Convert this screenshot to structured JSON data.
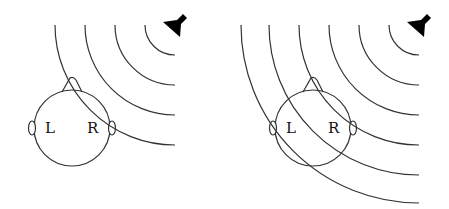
{
  "panels": [
    {
      "id": "left",
      "head": {
        "cx": 72,
        "cy": 128,
        "r": 38
      },
      "labels": {
        "left_ear": "L",
        "right_ear": "R"
      },
      "source": {
        "cx": 175,
        "cy": 25
      },
      "wave_radii": [
        30,
        60,
        90,
        120
      ]
    },
    {
      "id": "right",
      "head": {
        "cx": 313,
        "cy": 128,
        "r": 38
      },
      "labels": {
        "left_ear": "L",
        "right_ear": "R"
      },
      "source": {
        "cx": 419,
        "cy": 25
      },
      "wave_radii": [
        30,
        60,
        90,
        120,
        150,
        178
      ]
    }
  ],
  "colors": {
    "stroke": "#333333",
    "speaker": "#000000"
  }
}
